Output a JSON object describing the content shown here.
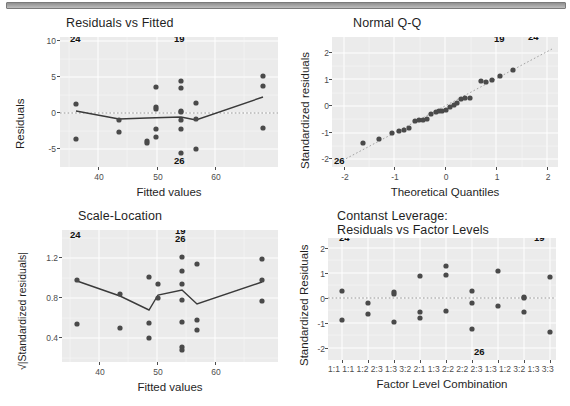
{
  "window": {
    "top_bar": "scrollbar-strip"
  },
  "figure": {
    "kind": "regression-diagnostic-plots",
    "panel_count": 4
  },
  "panels": [
    {
      "id": "residuals-vs-fitted",
      "title": "Residuals vs Fitted",
      "xlabel": "Fitted values",
      "ylabel": "Residuals",
      "xticks": [
        "40",
        "50",
        "60"
      ],
      "yticks": [
        "10",
        "5",
        "0",
        "-5"
      ],
      "point_labels": [
        "24",
        "19",
        "26"
      ]
    },
    {
      "id": "normal-qq",
      "title": "Normal Q-Q",
      "xlabel": "Theoretical Quantiles",
      "ylabel": "Standardized residuals",
      "xticks": [
        "-2",
        "-1",
        "0",
        "1",
        "2"
      ],
      "yticks": [
        "2",
        "1",
        "0",
        "-1",
        "-2"
      ],
      "point_labels": [
        "19",
        "24",
        "26"
      ]
    },
    {
      "id": "scale-location",
      "title": "Scale-Location",
      "xlabel": "Fitted values",
      "ylabel": "√|Standardized residuals|",
      "xticks": [
        "40",
        "50",
        "60"
      ],
      "yticks": [
        "1.2",
        "0.8",
        "0.4"
      ],
      "point_labels": [
        "24",
        "19",
        "26"
      ]
    },
    {
      "id": "constant-leverage",
      "title": "Contanst Leverage:\nResiduals vs Factor Levels",
      "xlabel": "Factor Level Combination",
      "ylabel": "Standardized Residuals",
      "xticks": [
        "1:1",
        "1:1",
        "1:2",
        "2:3",
        "1:3",
        "3:2",
        "2:1",
        "1:3",
        "2:2",
        "2:2",
        "2:3",
        "1:3",
        "1:2",
        "3:2",
        "1:3",
        "3:3"
      ],
      "yticks": [
        "2",
        "1",
        "0",
        "-1",
        "-2"
      ],
      "point_labels": [
        "24",
        "19",
        "26"
      ]
    }
  ],
  "colors": {
    "panel_bg": "#ebebeb",
    "grid": "#ffffff",
    "point": "#4a4a4a",
    "line": "#3a3a3a",
    "text": "#1f1f1f",
    "tick_text": "#4d4d4d"
  },
  "chart_data": [
    {
      "type": "scatter",
      "id": "residuals-vs-fitted",
      "title": "Residuals vs Fitted",
      "xlabel": "Fitted values",
      "ylabel": "Residuals",
      "xlim": [
        33.5,
        71.0
      ],
      "ylim": [
        -7.5,
        10.5
      ],
      "xticks": [
        40,
        50,
        60
      ],
      "yticks": [
        -5,
        0,
        5,
        10
      ],
      "grid": true,
      "zero_reference_line": 0,
      "points": [
        [
          36.2,
          1.2
        ],
        [
          36.2,
          -3.7
        ],
        [
          43.6,
          -0.9
        ],
        [
          43.6,
          -2.6
        ],
        [
          48.5,
          -3.9
        ],
        [
          48.5,
          -4.2
        ],
        [
          50.1,
          0.9
        ],
        [
          50.1,
          0.6
        ],
        [
          50.1,
          3.6
        ],
        [
          50.1,
          -2.3
        ],
        [
          50.1,
          -3.3
        ],
        [
          54.4,
          4.4
        ],
        [
          54.4,
          3.5
        ],
        [
          54.4,
          0.3
        ],
        [
          54.4,
          0.1
        ],
        [
          54.4,
          -1.0
        ],
        [
          54.4,
          -2.2
        ],
        [
          54.4,
          -5.5
        ],
        [
          57.0,
          1.4
        ],
        [
          57.0,
          -0.9
        ],
        [
          57.0,
          -5.0
        ],
        [
          68.5,
          5.2
        ],
        [
          68.5,
          3.8
        ],
        [
          68.5,
          -2.1
        ]
      ],
      "loess_line": [
        [
          36.2,
          0.3
        ],
        [
          43.6,
          -0.9
        ],
        [
          48.5,
          -0.75
        ],
        [
          54.4,
          -0.7
        ],
        [
          57.0,
          -1.1
        ],
        [
          68.5,
          2.5
        ]
      ],
      "annotations": [
        {
          "label": "24",
          "x": 36.2,
          "y": 9.8
        },
        {
          "label": "19",
          "x": 54.0,
          "y": 9.5
        },
        {
          "label": "26",
          "x": 54.4,
          "y": -6.8
        }
      ]
    },
    {
      "type": "scatter",
      "id": "normal-qq",
      "title": "Normal Q-Q",
      "xlabel": "Theoretical Quantiles",
      "ylabel": "Standardized residuals",
      "xlim": [
        -2.35,
        2.35
      ],
      "ylim": [
        -2.3,
        2.5
      ],
      "xticks": [
        -2,
        -1,
        0,
        1,
        2
      ],
      "yticks": [
        -2,
        -1,
        0,
        1,
        2
      ],
      "grid": true,
      "reference_line": {
        "type": "qq-diagonal",
        "from": [
          -2.35,
          -2.2
        ],
        "to": [
          2.1,
          2.1
        ]
      },
      "points": [
        [
          -1.62,
          -1.38
        ],
        [
          -1.3,
          -1.25
        ],
        [
          -1.05,
          -1.02
        ],
        [
          -0.92,
          -0.95
        ],
        [
          -0.82,
          -0.9
        ],
        [
          -0.72,
          -0.84
        ],
        [
          -0.6,
          -0.58
        ],
        [
          -0.52,
          -0.56
        ],
        [
          -0.44,
          -0.54
        ],
        [
          -0.36,
          -0.52
        ],
        [
          -0.27,
          -0.31
        ],
        [
          -0.18,
          -0.26
        ],
        [
          -0.12,
          -0.24
        ],
        [
          -0.05,
          -0.22
        ],
        [
          0.03,
          -0.2
        ],
        [
          0.1,
          -0.05
        ],
        [
          0.17,
          0.02
        ],
        [
          0.24,
          0.06
        ],
        [
          0.31,
          0.2
        ],
        [
          0.4,
          0.22
        ],
        [
          0.48,
          0.24
        ],
        [
          0.7,
          0.86
        ],
        [
          0.8,
          0.85
        ],
        [
          0.92,
          0.92
        ],
        [
          1.08,
          1.05
        ],
        [
          1.33,
          1.28
        ]
      ],
      "annotations": [
        {
          "label": "19",
          "x": 1.55,
          "y": 2.25
        },
        {
          "label": "24",
          "x": 2.02,
          "y": 2.32
        },
        {
          "label": "26",
          "x": -2.18,
          "y": -2.1
        }
      ]
    },
    {
      "type": "scatter",
      "id": "scale-location",
      "title": "Scale-Location",
      "xlabel": "Fitted values",
      "ylabel": "√|Standardized residuals|",
      "xlim": [
        33.5,
        71.0
      ],
      "ylim": [
        0.18,
        1.45
      ],
      "xticks": [
        40,
        50,
        60
      ],
      "yticks": [
        0.4,
        0.8,
        1.2
      ],
      "grid": true,
      "points": [
        [
          36.2,
          0.95
        ],
        [
          36.2,
          0.51
        ],
        [
          43.6,
          0.81
        ],
        [
          43.6,
          0.47
        ],
        [
          48.5,
          0.98
        ],
        [
          48.5,
          0.52
        ],
        [
          48.5,
          0.37
        ],
        [
          50.1,
          0.91
        ],
        [
          50.1,
          0.77
        ],
        [
          54.4,
          1.18
        ],
        [
          54.4,
          1.04
        ],
        [
          54.4,
          0.91
        ],
        [
          54.4,
          0.75
        ],
        [
          54.4,
          0.53
        ],
        [
          54.4,
          0.28
        ],
        [
          54.4,
          0.26
        ],
        [
          57.0,
          1.11
        ],
        [
          57.0,
          0.55
        ],
        [
          57.0,
          0.45
        ],
        [
          68.5,
          1.16
        ],
        [
          68.5,
          0.95
        ],
        [
          68.5,
          0.74
        ]
      ],
      "loess_line": [
        [
          36.2,
          0.92
        ],
        [
          43.6,
          0.77
        ],
        [
          48.5,
          0.63
        ],
        [
          50.1,
          0.78
        ],
        [
          54.4,
          0.84
        ],
        [
          57.0,
          0.7
        ],
        [
          68.5,
          0.94
        ]
      ],
      "annotations": [
        {
          "label": "24",
          "x": 36.2,
          "y": 1.4
        },
        {
          "label": "19",
          "x": 54.4,
          "y": 1.4
        },
        {
          "label": "26",
          "x": 54.4,
          "y": 1.33
        }
      ]
    },
    {
      "type": "scatter",
      "id": "constant-leverage",
      "title": "Contanst Leverage:\nResiduals vs Factor Levels",
      "xlabel": "Factor Level Combination",
      "ylabel": "Standardized Residuals",
      "xlim": [
        0.4,
        9.6
      ],
      "ylim": [
        -2.35,
        2.5
      ],
      "xticks": [
        1,
        2,
        3,
        4,
        5,
        6,
        7,
        8,
        9
      ],
      "yticks": [
        -2,
        -1,
        0,
        1,
        2
      ],
      "grid": true,
      "zero_reference_line": 0,
      "points": [
        [
          1,
          0.26
        ],
        [
          1,
          -0.9
        ],
        [
          2,
          -0.22
        ],
        [
          2,
          -0.65
        ],
        [
          3,
          0.22
        ],
        [
          3,
          0.14
        ],
        [
          3,
          -0.95
        ],
        [
          4,
          0.86
        ],
        [
          4,
          -0.58
        ],
        [
          4,
          -0.82
        ],
        [
          5,
          1.28
        ],
        [
          5,
          0.92
        ],
        [
          5,
          -0.53
        ],
        [
          6,
          0.28
        ],
        [
          6,
          -0.21
        ],
        [
          6,
          -1.24
        ],
        [
          7,
          1.06
        ],
        [
          7,
          -0.31
        ],
        [
          8,
          0.03
        ],
        [
          8,
          -0.02
        ],
        [
          8,
          -0.56
        ],
        [
          9,
          0.84
        ],
        [
          9,
          -1.36
        ]
      ],
      "annotations": [
        {
          "label": "24",
          "x": 1.05,
          "y": 2.3
        },
        {
          "label": "19",
          "x": 9.1,
          "y": 2.3
        },
        {
          "label": "26",
          "x": 6.3,
          "y": -2.2
        }
      ]
    }
  ]
}
